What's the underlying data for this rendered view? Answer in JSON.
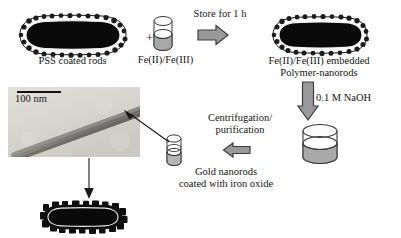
{
  "figure": {
    "kind": "reaction-scheme",
    "caption_labels": {
      "pss_rods": "PSS coated rods",
      "plus": "+",
      "iron_precursor": "Fe(II)/Fe(III)",
      "store_step": "Store for 1 h",
      "fe_embedded_line1": "Fe(II)/Fe(III) embedded",
      "fe_embedded_line2": "Polymer-nanorods",
      "naoh_step": "0.1 M NaOH",
      "centrifugation_line1": "Centrifugation/",
      "centrifugation_line2": "purification",
      "gold_nanorods_line1": "Gold nanorods",
      "gold_nanorods_line2": "coated with iron oxide"
    },
    "tem": {
      "scale_bar_label": "100 nm"
    },
    "colors": {
      "arrow_fill": "#9a9a9a",
      "arrow_stroke": "#3d3d3d",
      "rod_core": "#0a0a0a",
      "vial_liquid": "#a8a8a8",
      "tem_background": "#d6d4cf",
      "text": "#141414"
    }
  }
}
